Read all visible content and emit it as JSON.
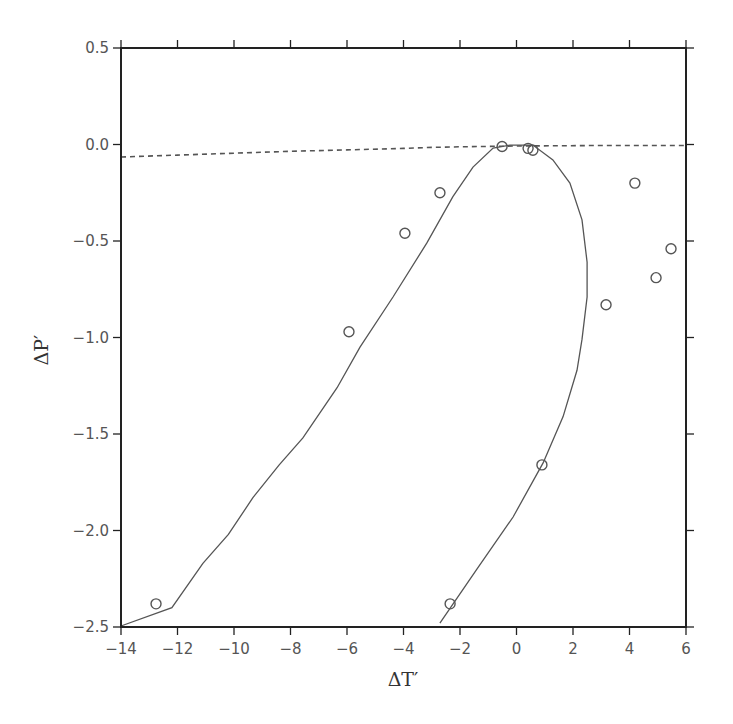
{
  "chart_data": {
    "type": "scatter",
    "title": "",
    "xlabel": "ΔT′",
    "ylabel": "ΔP′",
    "xlim": [
      -14,
      6
    ],
    "ylim": [
      -2.5,
      0.5
    ],
    "grid": false,
    "legend": null,
    "x_ticks": [
      -14,
      -12,
      -10,
      -8,
      -6,
      -4,
      -2,
      0,
      2,
      4,
      6
    ],
    "x_tick_labels": [
      "−14",
      "−12",
      "−10",
      "−8",
      "−6",
      "−4",
      "−2",
      "0",
      "2",
      "4",
      "6"
    ],
    "y_ticks": [
      0.5,
      0.0,
      -0.5,
      -1.0,
      -1.5,
      -2.0,
      -2.5
    ],
    "y_tick_labels": [
      "0.5",
      "0.0",
      "−0.5",
      "−1.0",
      "−1.5",
      "−2.0",
      "−2.5"
    ],
    "series": [
      {
        "name": "observations",
        "type": "scatter",
        "marker": "open-circle",
        "points": [
          [
            -12.76,
            -2.38
          ],
          [
            -5.93,
            -0.97
          ],
          [
            -3.95,
            -0.46
          ],
          [
            -2.71,
            -0.25
          ],
          [
            -0.51,
            -0.01
          ],
          [
            0.41,
            -0.02
          ],
          [
            0.58,
            -0.03
          ],
          [
            4.19,
            -0.2
          ],
          [
            5.47,
            -0.54
          ],
          [
            4.94,
            -0.69
          ],
          [
            3.17,
            -0.83
          ],
          [
            0.9,
            -1.66
          ],
          [
            -2.35,
            -2.38
          ]
        ]
      },
      {
        "name": "fitted-curve",
        "type": "line",
        "style": "solid",
        "points": [
          [
            -14.0,
            -2.495
          ],
          [
            -12.2,
            -2.4
          ],
          [
            -11.1,
            -2.17
          ],
          [
            -10.2,
            -2.02
          ],
          [
            -9.33,
            -1.83
          ],
          [
            -8.4,
            -1.66
          ],
          [
            -7.56,
            -1.52
          ],
          [
            -6.35,
            -1.26
          ],
          [
            -5.54,
            -1.05
          ],
          [
            -4.37,
            -0.79
          ],
          [
            -3.17,
            -0.51
          ],
          [
            -2.25,
            -0.27
          ],
          [
            -1.54,
            -0.117
          ],
          [
            -0.83,
            -0.018
          ],
          [
            -0.23,
            -0.003
          ],
          [
            0.58,
            -0.003
          ],
          [
            1.29,
            -0.08
          ],
          [
            1.89,
            -0.2
          ],
          [
            2.32,
            -0.39
          ],
          [
            2.5,
            -0.61
          ],
          [
            2.5,
            -0.79
          ],
          [
            2.32,
            -1.01
          ],
          [
            2.14,
            -1.17
          ],
          [
            1.65,
            -1.41
          ],
          [
            0.94,
            -1.65
          ],
          [
            -0.12,
            -1.93
          ],
          [
            -1.4,
            -2.2
          ],
          [
            -2.71,
            -2.48
          ]
        ]
      },
      {
        "name": "reference-curve",
        "type": "line",
        "style": "dashed",
        "points": [
          [
            -14,
            -0.065
          ],
          [
            -12,
            -0.055
          ],
          [
            -10,
            -0.045
          ],
          [
            -8,
            -0.035
          ],
          [
            -6,
            -0.028
          ],
          [
            -4,
            -0.02
          ],
          [
            -3,
            -0.015
          ],
          [
            -2,
            -0.012
          ],
          [
            0,
            -0.008
          ],
          [
            3,
            -0.005
          ],
          [
            6,
            -0.005
          ]
        ]
      }
    ]
  },
  "colors": {
    "axis": "#222222",
    "curve": "#555555",
    "marker": "#555555",
    "tick_label": "#555555"
  }
}
